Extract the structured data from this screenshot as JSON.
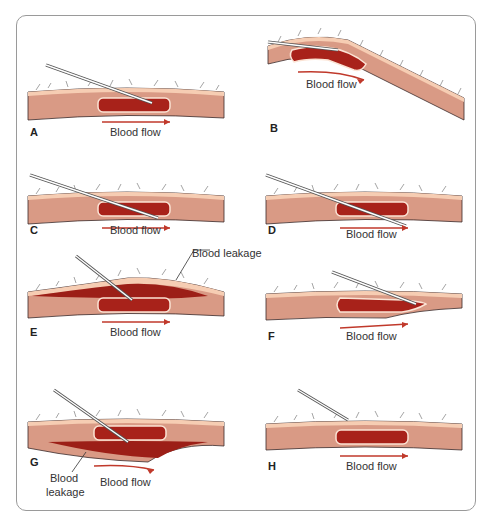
{
  "figure": {
    "panels": [
      {
        "id": "A",
        "letter": "A",
        "flow_label": "Blood flow"
      },
      {
        "id": "B",
        "letter": "B",
        "flow_label": "Blood flow"
      },
      {
        "id": "C",
        "letter": "C",
        "flow_label": "Blood flow"
      },
      {
        "id": "D",
        "letter": "D",
        "flow_label": "Blood flow"
      },
      {
        "id": "E",
        "letter": "E",
        "flow_label": "Blood flow",
        "callout": "Blood leakage"
      },
      {
        "id": "F",
        "letter": "F",
        "flow_label": "Blood flow"
      },
      {
        "id": "G",
        "letter": "G",
        "flow_label": "Blood flow",
        "callout_line1": "Blood",
        "callout_line2": "leakage"
      },
      {
        "id": "H",
        "letter": "H",
        "flow_label": "Blood flow"
      }
    ],
    "colors": {
      "skin_surface": "#f6cdb3",
      "tissue": "#d99a85",
      "vein": "#a8221a",
      "blood_leak": "#9c1f17",
      "arrow": "#c0392b",
      "needle": "#555555",
      "frame": "#9a9a9a"
    }
  }
}
